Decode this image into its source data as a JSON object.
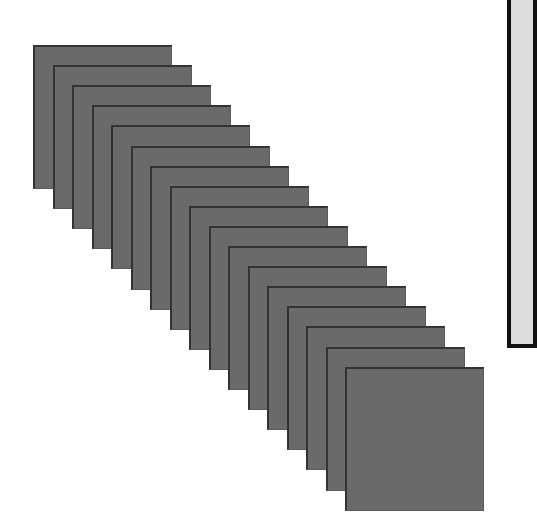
{
  "scene": {
    "background": "#ffffff",
    "card_fill": "#6a6a6a",
    "card_edge": "#333333",
    "card_count": 17,
    "card_size": {
      "width": 139,
      "height": 144
    },
    "first_card_origin": {
      "x": 33,
      "y": 45
    },
    "step": {
      "dx": 19.5,
      "dy": 20.1
    }
  },
  "side_panel": {
    "fill": "#dcdcdc",
    "border": "#111111"
  }
}
